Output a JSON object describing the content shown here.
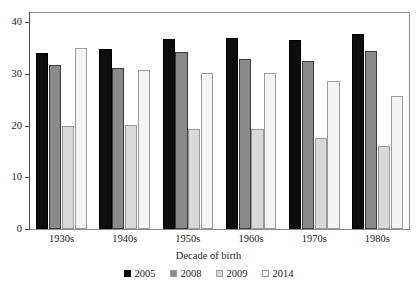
{
  "chart_data": {
    "type": "bar",
    "title": "",
    "xlabel": "Decade of birth",
    "ylabel": "",
    "categories": [
      "1930s",
      "1940s",
      "1950s",
      "1960s",
      "1970s",
      "1980s"
    ],
    "series": [
      {
        "name": "2005",
        "color": "#0d0d0d",
        "values": [
          34.0,
          34.8,
          36.7,
          37.0,
          36.5,
          37.8
        ]
      },
      {
        "name": "2008",
        "color": "#8a8a8a",
        "values": [
          31.7,
          31.2,
          34.3,
          33.0,
          32.5,
          34.4
        ]
      },
      {
        "name": "2009",
        "color": "#d9d9d9",
        "values": [
          20.0,
          20.2,
          19.4,
          19.3,
          17.6,
          16.0
        ]
      },
      {
        "name": "2014",
        "color": "#f4f4f4",
        "values": [
          35.0,
          30.8,
          30.1,
          30.2,
          28.7,
          25.8
        ]
      }
    ],
    "ylim": [
      0,
      42
    ],
    "yticks": [
      0,
      10,
      20,
      30,
      40
    ],
    "ytick_labels": [
      "0",
      "10",
      "20",
      "30",
      "40"
    ],
    "grid": false,
    "legend_position": "bottom"
  }
}
